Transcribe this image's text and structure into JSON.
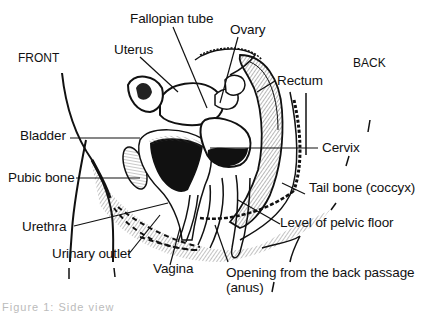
{
  "figure": {
    "orientation": {
      "front": "FRONT",
      "back": "BACK"
    },
    "labels": {
      "fallopian_tube": "Fallopian tube",
      "ovary": "Ovary",
      "uterus": "Uterus",
      "rectum": "Rectum",
      "bladder": "Bladder",
      "cervix": "Cervix",
      "pubic_bone": "Pubic bone",
      "tail_bone": "Tail bone (coccyx)",
      "level_pelvic_floor": "Level of pelvic floor",
      "urethra": "Urethra",
      "urinary_outlet": "Urinary outlet",
      "vagina": "Vagina",
      "anus_line1": "Opening from the back passage",
      "anus_line2": "(anus)"
    },
    "caption": "Figure 1: Side view"
  }
}
